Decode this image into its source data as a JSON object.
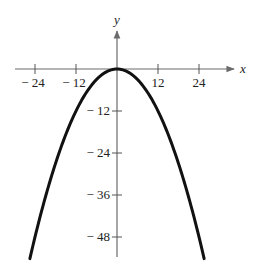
{
  "chart_data": {
    "type": "line",
    "title": "",
    "xlabel": "x",
    "ylabel": "y",
    "xlim": [
      -28.5,
      35
    ],
    "ylim": [
      -55,
      10
    ],
    "x_ticks": [
      -24,
      -12,
      12,
      24
    ],
    "x_tick_labels": [
      "− 24",
      "− 12",
      "12",
      "24"
    ],
    "y_ticks": [
      -12,
      -24,
      -36,
      -48
    ],
    "y_tick_labels": [
      "− 12",
      "− 24",
      "− 36",
      "− 48"
    ],
    "grid": false,
    "legend": "none",
    "series": [
      {
        "name": "parabola",
        "equation": "y = -x^2/12",
        "x_range": [
          -25.5,
          25.5
        ],
        "x": [
          -25.5,
          -24,
          -18,
          -12,
          -6,
          0,
          6,
          12,
          18,
          24,
          25.5
        ],
        "y": [
          -54.19,
          -48,
          -27,
          -12,
          -3,
          0,
          -3,
          -12,
          -27,
          -48,
          -54.19
        ],
        "color": "#111111"
      }
    ]
  }
}
